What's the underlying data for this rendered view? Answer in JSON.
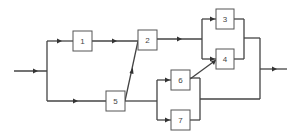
{
  "diagram": {
    "type": "reliability-block-diagram",
    "line_color": "#444444",
    "box_border_color": "#555555",
    "blocks": [
      {
        "id": "1",
        "label": "1"
      },
      {
        "id": "2",
        "label": "2"
      },
      {
        "id": "3",
        "label": "3"
      },
      {
        "id": "4",
        "label": "4"
      },
      {
        "id": "5",
        "label": "5"
      },
      {
        "id": "6",
        "label": "6"
      },
      {
        "id": "7",
        "label": "7"
      }
    ],
    "connections": [
      {
        "from": "input",
        "to": "1"
      },
      {
        "from": "input",
        "to": "5"
      },
      {
        "from": "1",
        "to": "2"
      },
      {
        "from": "5",
        "to": "2"
      },
      {
        "from": "5",
        "to": "6"
      },
      {
        "from": "5",
        "to": "7"
      },
      {
        "from": "2",
        "to": "3"
      },
      {
        "from": "2",
        "to": "4"
      },
      {
        "from": "6",
        "to": "4"
      },
      {
        "from": "3",
        "to": "output"
      },
      {
        "from": "4",
        "to": "output"
      },
      {
        "from": "6",
        "to": "output"
      },
      {
        "from": "7",
        "to": "output"
      }
    ]
  }
}
